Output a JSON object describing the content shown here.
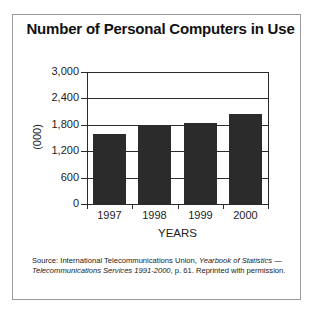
{
  "chart_data": {
    "type": "bar",
    "title": "Number of Personal Computers in Use",
    "categories": [
      "1997",
      "1998",
      "1999",
      "2000"
    ],
    "values": [
      1600,
      1790,
      1850,
      2050
    ],
    "xlabel": "YEARS",
    "ylabel": "(000)",
    "ylim": [
      0,
      3000
    ],
    "yticks": [
      0,
      600,
      1200,
      1800,
      2400,
      3000
    ],
    "ytick_labels": [
      "0",
      "600",
      "1,200",
      "1,800",
      "2,400",
      "3,000"
    ],
    "grid": true,
    "legend": null,
    "bar_color": "#2b2b2b"
  },
  "source": {
    "prefix": "Source: International Telecommunications Union, ",
    "italic1": "Yearbook of Statistics — Telecommunications Services 1991-2000",
    "suffix": ", p. 61. Reprinted with permission."
  }
}
